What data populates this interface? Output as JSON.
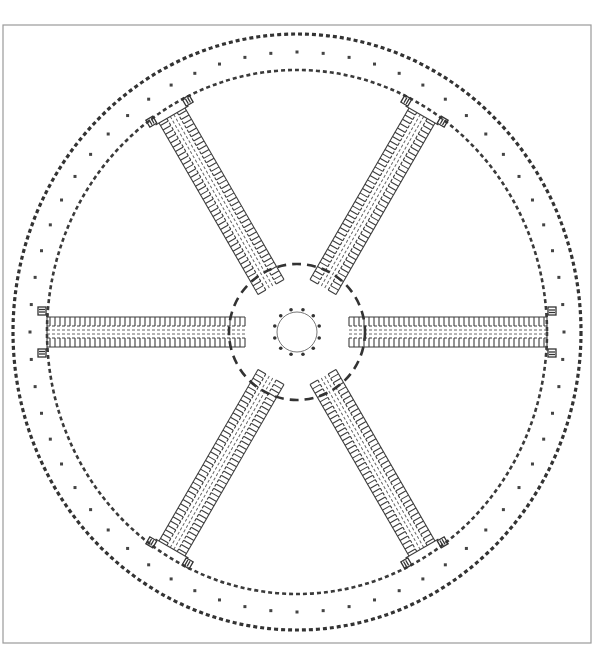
{
  "drawing": {
    "type": "architectural-floor-plan",
    "subject": "radial plan with six cell wings around a central circular hall",
    "canvas": {
      "width": 602,
      "height": 645
    },
    "frame": {
      "x": 3,
      "y": 25,
      "width": 588,
      "height": 618,
      "color": "#9a9a9a"
    },
    "center": {
      "x": 297,
      "y": 332
    },
    "ink_color": "#333333",
    "central_hall": {
      "radius": 20,
      "column_count": 12,
      "column_ring_radius": 23
    },
    "inner_yard_ring": {
      "radius": 68,
      "style": "dashed"
    },
    "enclosure": {
      "inner_wall": {
        "rx": 250,
        "ry": 262,
        "style": "dashed"
      },
      "outer_wall": {
        "rx": 284,
        "ry": 298,
        "style": "dashed"
      },
      "pier_row": {
        "rx": 267,
        "ry": 280,
        "count": 64
      }
    },
    "wings": [
      {
        "name": "east-wing",
        "angle_deg": 0
      },
      {
        "name": "south-east-wing",
        "angle_deg": 60
      },
      {
        "name": "south-west-wing",
        "angle_deg": 120
      },
      {
        "name": "west-wing",
        "angle_deg": 180
      },
      {
        "name": "north-west-wing",
        "angle_deg": 240
      },
      {
        "name": "north-east-wing",
        "angle_deg": 300
      }
    ],
    "wing_geometry": {
      "start_radius": 52,
      "end_radius": 250,
      "width": 30,
      "cell_depth": 9,
      "cell_pitch": 5
    }
  }
}
